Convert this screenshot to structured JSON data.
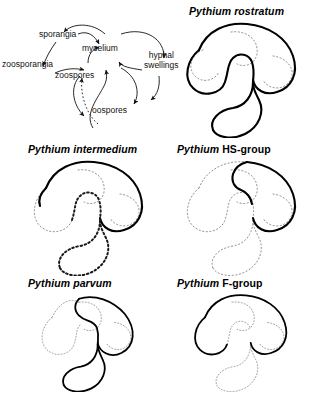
{
  "figure": {
    "background_color": "#ffffff",
    "stroke_color": "#000000",
    "dotted_color": "#8c8c8c"
  },
  "legend": {
    "name": "pythium-life-cycle-legend",
    "nodes": [
      {
        "id": "sporangia",
        "label": "sporangia"
      },
      {
        "id": "mycelium",
        "label": "mycelium"
      },
      {
        "id": "zoosporangia",
        "label": "zoosporangia"
      },
      {
        "id": "zoospores",
        "label": "zoospores"
      },
      {
        "id": "hyphal_swellings",
        "label": "hyphal\nswellings",
        "line1": "hyphal",
        "line2": "swellings"
      },
      {
        "id": "oospores",
        "label": "oospores"
      }
    ]
  },
  "panels": [
    {
      "id": "rostratum",
      "title_genus": "Pythium",
      "title_epithet": "rostratum",
      "title_epithet_style": "italic",
      "solid_segments": [
        "left-lobe",
        "top-arc",
        "right-lobe",
        "bottom-s-curve"
      ],
      "dotted_segments": [
        "inner-left-loop",
        "inner-right-loop"
      ]
    },
    {
      "id": "intermedium",
      "title_genus": "Pythium",
      "title_epithet": "intermedium",
      "title_epithet_style": "italic",
      "solid_segments": [
        "top-arc"
      ],
      "dotted_segments": [
        "left-lobe",
        "right-lobe",
        "bottom-s-curve",
        "inner-loops"
      ]
    },
    {
      "id": "hs-group",
      "title_genus": "Pythium",
      "title_epithet": "HS-group",
      "title_epithet_style": "upright",
      "solid_segments": [
        "right-lobe"
      ],
      "dotted_segments": [
        "left-lobe",
        "top-arc",
        "bottom-s-curve",
        "inner-loops"
      ]
    },
    {
      "id": "parvum",
      "title_genus": "Pythium",
      "title_epithet": "parvum",
      "title_epithet_style": "italic",
      "solid_segments": [
        "top-arc",
        "right-lobe",
        "bottom-s-curve"
      ],
      "dotted_segments": [
        "left-lobe",
        "inner-loops"
      ]
    },
    {
      "id": "f-group",
      "title_genus": "Pythium",
      "title_epithet": "F-group",
      "title_epithet_style": "upright",
      "solid_segments": [
        "top-arc",
        "left-lobe"
      ],
      "dotted_segments": [
        "right-lobe",
        "bottom-s-curve",
        "inner-loops"
      ]
    }
  ]
}
